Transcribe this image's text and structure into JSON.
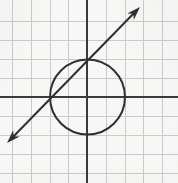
{
  "figure": {
    "width": 178,
    "height": 183,
    "background_color": "#f7f7f5",
    "ink_color": "#3a3a3a",
    "grid_color": "#c9c9cf"
  },
  "chart_data": {
    "type": "scatter",
    "subtitle": "",
    "xlabel": "",
    "ylabel": "",
    "grid": true,
    "legend": null,
    "legend_position": "none",
    "axis_style": "cartesian-cross",
    "units_per_cell": 1,
    "pixels_per_cell": 18.8,
    "origin_px": {
      "x": 87,
      "y": 97
    },
    "xlim": [
      -4.5,
      4.8
    ],
    "ylim": [
      -4.5,
      5.1
    ],
    "xticks": [
      -4,
      -3,
      -2,
      -1,
      0,
      1,
      2,
      3,
      4
    ],
    "yticks": [
      -4,
      -3,
      -2,
      -1,
      0,
      1,
      2,
      3,
      4
    ],
    "xtick_labels": [
      "",
      "",
      "",
      "",
      "",
      "",
      "",
      "",
      ""
    ],
    "ytick_labels": [
      "",
      "",
      "",
      "",
      "",
      "",
      "",
      "",
      ""
    ],
    "gridlines_vertical_px": [
      12,
      31,
      50,
      68,
      87,
      106,
      125,
      143,
      162
    ],
    "gridlines_horizontal_px": [
      21,
      40,
      59,
      78,
      97,
      116,
      135,
      154,
      173
    ],
    "series": [
      {
        "name": "circle",
        "type": "circle",
        "center": [
          0,
          0
        ],
        "radius": 2,
        "center_px": [
          87.5,
          97
        ],
        "radius_px": 37.5,
        "equation": "x^2 + y^2 = 4",
        "stroke": "#2f2f2f",
        "stroke_width": 2,
        "fill": "none"
      },
      {
        "name": "line",
        "type": "line",
        "slope": 1,
        "intercept": 2,
        "equation": "y = x + 2",
        "arrow_start": true,
        "arrow_end": true,
        "endpoints_px": [
          [
            7,
            143
          ],
          [
            140,
            7
          ]
        ],
        "intersections": [
          [
            -2,
            0
          ],
          [
            0,
            2
          ]
        ],
        "intersections_px": [
          [
            50,
            97
          ],
          [
            87.5,
            59.5
          ]
        ],
        "stroke": "#2f2f2f",
        "stroke_width": 2
      }
    ],
    "annotations": []
  },
  "axes": {
    "x_axis": {
      "name": "x-axis",
      "y_px": 97,
      "x_start_px": 0,
      "x_end_px": 178,
      "stroke": "#3a3a3a",
      "stroke_width": 2
    },
    "y_axis": {
      "name": "y-axis",
      "x_px": 87,
      "y_start_px": 0,
      "y_end_px": 183,
      "stroke": "#3a3a3a",
      "stroke_width": 2
    }
  },
  "arrowheads": [
    {
      "name": "arrowhead-upper-right",
      "tip_px": [
        140,
        7
      ],
      "direction_deg": -45.6
    },
    {
      "name": "arrowhead-lower-left",
      "tip_px": [
        7,
        143
      ],
      "direction_deg": 134.4
    }
  ]
}
